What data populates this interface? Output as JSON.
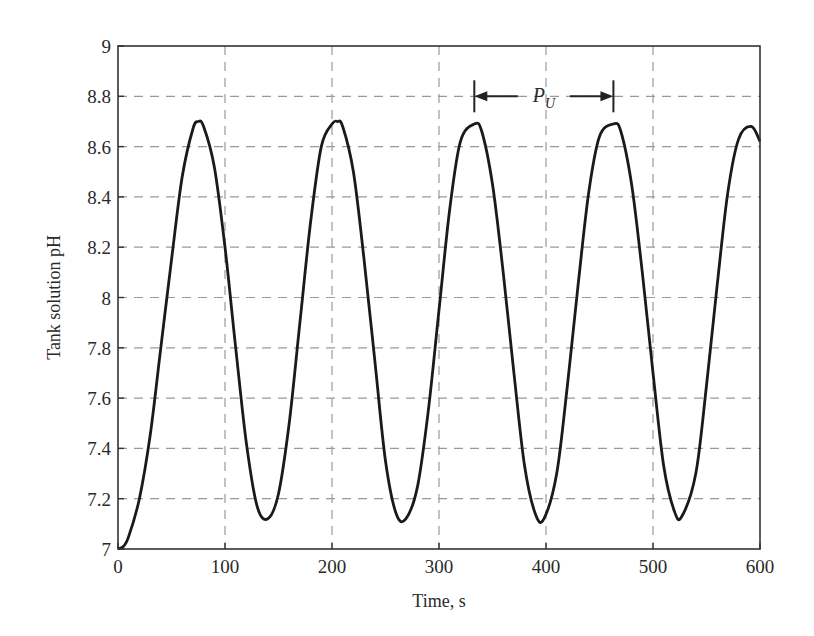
{
  "chart_data": {
    "type": "line",
    "title": "",
    "xlabel": "Time, s",
    "ylabel": "Tank solution pH",
    "xlim": [
      0,
      600
    ],
    "ylim": [
      7,
      9
    ],
    "xticks": [
      0,
      100,
      200,
      300,
      400,
      500,
      600
    ],
    "yticks": [
      7,
      7.2,
      7.4,
      7.6,
      7.8,
      8,
      8.2,
      8.4,
      8.6,
      8.8,
      9
    ],
    "xtick_labels": [
      "0",
      "100",
      "200",
      "300",
      "400",
      "500",
      "600"
    ],
    "ytick_labels": [
      "7",
      "7.2",
      "7.4",
      "7.6",
      "7.8",
      "8",
      "8.2",
      "8.4",
      "8.6",
      "8.8",
      "9"
    ],
    "grid": true,
    "grid_style": "dashed",
    "legend": null,
    "series": [
      {
        "name": "Tank solution pH",
        "color": "#1a1a1a",
        "x": [
          0,
          5,
          10,
          20,
          30,
          40,
          50,
          60,
          70,
          75,
          80,
          90,
          100,
          110,
          120,
          130,
          140,
          150,
          160,
          170,
          180,
          190,
          200,
          205,
          210,
          220,
          230,
          240,
          250,
          260,
          269,
          280,
          290,
          300,
          310,
          320,
          333,
          340,
          350,
          360,
          370,
          380,
          390,
          398,
          410,
          420,
          430,
          440,
          450,
          463,
          470,
          480,
          490,
          500,
          510,
          520,
          527,
          540,
          550,
          560,
          570,
          580,
          592,
          600
        ],
        "y": [
          7.0,
          7.01,
          7.05,
          7.2,
          7.45,
          7.8,
          8.15,
          8.48,
          8.67,
          8.7,
          8.68,
          8.52,
          8.2,
          7.8,
          7.42,
          7.17,
          7.12,
          7.22,
          7.5,
          7.9,
          8.3,
          8.6,
          8.69,
          8.7,
          8.68,
          8.5,
          8.15,
          7.75,
          7.35,
          7.14,
          7.12,
          7.25,
          7.55,
          7.95,
          8.35,
          8.62,
          8.69,
          8.66,
          8.45,
          8.1,
          7.7,
          7.33,
          7.14,
          7.12,
          7.3,
          7.65,
          8.05,
          8.42,
          8.64,
          8.69,
          8.66,
          8.45,
          8.1,
          7.7,
          7.33,
          7.15,
          7.13,
          7.3,
          7.65,
          8.05,
          8.42,
          8.63,
          8.68,
          8.62
        ]
      }
    ],
    "annotations": [
      {
        "text": "P",
        "subscript": "U",
        "meaning": "ultimate period (double-headed arrow between successive peaks)",
        "x_start": 333,
        "x_end": 463,
        "y": 8.8
      }
    ]
  },
  "axes": {
    "xlabel": "Time, s",
    "ylabel": "Tank solution pH"
  },
  "annotation": {
    "main": "P",
    "sub": "U"
  }
}
